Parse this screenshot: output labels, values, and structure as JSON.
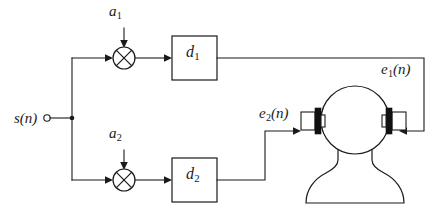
{
  "diagram": {
    "background_color": "#ffffff",
    "line_color": "#1a1a1a",
    "speaker_bar_color": "#111111"
  },
  "labels": {
    "input_signal": {
      "base": "s",
      "sub": "",
      "arg": "(n)",
      "full": "s(n)"
    },
    "gain_top": {
      "base": "a",
      "sub": "1",
      "arg": "",
      "full": "a1"
    },
    "gain_bottom": {
      "base": "a",
      "sub": "2",
      "arg": "",
      "full": "a2"
    },
    "filter_top": {
      "base": "d",
      "sub": "1",
      "arg": "",
      "full": "d1"
    },
    "filter_bottom": {
      "base": "d",
      "sub": "2",
      "arg": "",
      "full": "d2"
    },
    "output_right_ear": {
      "base": "e",
      "sub": "1",
      "arg": "(n)",
      "full": "e1(n)"
    },
    "output_left_ear": {
      "base": "e",
      "sub": "2",
      "arg": "(n)",
      "full": "e2(n)"
    }
  },
  "nodes": {
    "input_terminal": {
      "name": "s(n) input terminal",
      "x": 68,
      "y": 118
    },
    "branch_junction": {
      "name": "signal split junction",
      "x": 72,
      "y": 118
    },
    "multiplier_top": {
      "name": "multiplier a1",
      "x": 124,
      "y": 58,
      "symbol": "x-in-circle"
    },
    "multiplier_bottom": {
      "name": "multiplier a2",
      "x": 124,
      "y": 180,
      "symbol": "x-in-circle"
    },
    "block_top": {
      "name": "filter d1",
      "x": 172,
      "y": 36,
      "w": 45,
      "h": 44
    },
    "block_bottom": {
      "name": "filter d2",
      "x": 172,
      "y": 158,
      "w": 45,
      "h": 44
    },
    "head": {
      "name": "listener head and shoulders",
      "cx": 355,
      "cy": 120
    },
    "speaker_left": {
      "name": "left ear transducer",
      "x": 300,
      "y": 120
    },
    "speaker_right": {
      "name": "right ear transducer",
      "x": 392,
      "y": 120
    }
  },
  "signal_paths": [
    {
      "name": "input to top multiplier",
      "from": "s(n)",
      "to": "multiplier a1"
    },
    {
      "name": "input to bottom multiplier",
      "from": "s(n)",
      "to": "multiplier a2"
    },
    {
      "name": "gain a1 into top multiplier",
      "from": "a1",
      "to": "multiplier a1"
    },
    {
      "name": "gain a2 into bottom multiplier",
      "from": "a2",
      "to": "multiplier a2"
    },
    {
      "name": "top multiplier to d1",
      "from": "multiplier a1",
      "to": "d1"
    },
    {
      "name": "bottom multiplier to d2",
      "from": "multiplier a2",
      "to": "d2"
    },
    {
      "name": "d1 output e1(n) to right ear",
      "from": "d1",
      "to": "right ear transducer"
    },
    {
      "name": "d2 output e2(n) to left ear",
      "from": "d2",
      "to": "left ear transducer"
    }
  ]
}
